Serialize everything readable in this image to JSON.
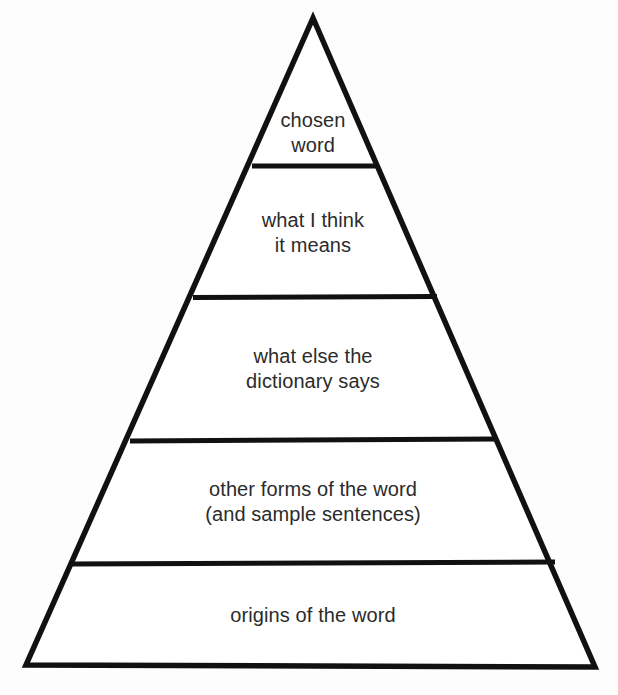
{
  "diagram": {
    "type": "pyramid",
    "background_color": "#fdfdfd",
    "stroke_color": "#111111",
    "text_color": "#2b2b2b",
    "stroke_width": 5,
    "orientation": "apex-top",
    "tier_count": 5,
    "tiers": [
      {
        "index": 1,
        "position": "top",
        "label": "chosen\nword",
        "lines": [
          "chosen",
          "word"
        ]
      },
      {
        "index": 2,
        "position": "second",
        "label": "what I think\nit means",
        "lines": [
          "what I think",
          "it means"
        ]
      },
      {
        "index": 3,
        "position": "middle",
        "label": "what else the\ndictionary says",
        "lines": [
          "what else the",
          "dictionary says"
        ]
      },
      {
        "index": 4,
        "position": "fourth",
        "label": "other forms of the word\n(and sample sentences)",
        "lines": [
          "other forms of the word",
          "(and sample sentences)"
        ]
      },
      {
        "index": 5,
        "position": "base",
        "label": "origins of the word",
        "lines": [
          "origins of the word"
        ]
      }
    ],
    "geometry": {
      "apex": [
        313,
        18
      ],
      "base_left": [
        26,
        665
      ],
      "base_right": [
        595,
        667
      ],
      "divider_y": [
        166,
        297,
        440,
        563
      ]
    }
  }
}
